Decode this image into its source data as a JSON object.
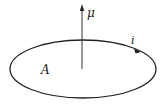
{
  "diagram": {
    "type": "current-loop-magnetic-moment",
    "labels": {
      "moment": "μ",
      "current": "i",
      "area": "A"
    },
    "colors": {
      "stroke": "#222222",
      "background": "#ffffff"
    }
  }
}
